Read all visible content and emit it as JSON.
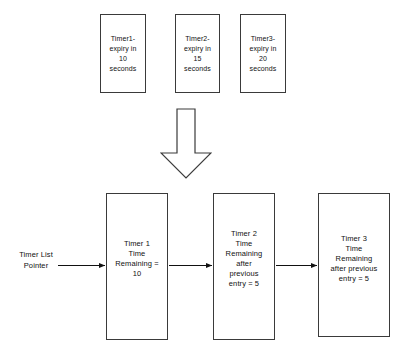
{
  "diagram": {
    "background_color": "#ffffff",
    "line_color": "#3a3a3a",
    "text_color": "#111111"
  },
  "top_row": {
    "boxes": [
      {
        "id": "timer1-expiry",
        "text": "Timer1-\nexpiry in\n10\nseconds"
      },
      {
        "id": "timer2-expiry",
        "text": "Timer2-\nexpiry in\n15\nseconds"
      },
      {
        "id": "timer3-expiry",
        "text": "Timer3-\nexpiry in\n20\nseconds"
      }
    ]
  },
  "transform_arrow": {
    "direction": "down",
    "style": "hollow-block-arrow"
  },
  "pointer": {
    "label": "Timer List\nPointer"
  },
  "bottom_row": {
    "boxes": [
      {
        "id": "timer1-entry",
        "text": "Timer 1\nTime\nRemaining =\n10"
      },
      {
        "id": "timer2-entry",
        "text": "Timer 2\nTime\nRemaining\nafter\nprevious\nentry = 5"
      },
      {
        "id": "timer3-entry",
        "text": "Timer 3\nTime\nRemaining\nafter previous\nentry = 5"
      }
    ]
  },
  "connectors": [
    {
      "id": "pointer-to-timer1",
      "from": "Timer List Pointer",
      "to": "Timer 1"
    },
    {
      "id": "timer1-to-timer2",
      "from": "Timer 1",
      "to": "Timer 2"
    },
    {
      "id": "timer2-to-timer3",
      "from": "Timer 2",
      "to": "Timer 3"
    }
  ]
}
